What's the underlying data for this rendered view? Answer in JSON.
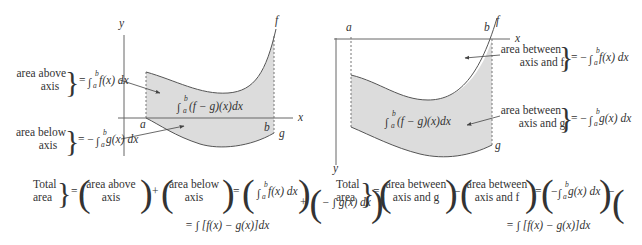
{
  "colors": {
    "fill": "#dcdcdc",
    "curve": "#555555",
    "axis": "#666666",
    "text": "#333333"
  },
  "left_figure": {
    "axis_x_label": "x",
    "axis_y_label": "y",
    "point_a": "a",
    "point_b": "b",
    "curve_f": "f",
    "curve_g": "g",
    "center_integral": "∫(f − g)(x)dx",
    "label_above": {
      "line1": "area above",
      "line2": "axis",
      "equals": "= ∫ f(x) dx"
    },
    "label_below": {
      "line1": "area below",
      "line2": "axis",
      "equals": "= − ∫ g(x) dx"
    },
    "equation": {
      "lhs_line1": "Total",
      "lhs_line2": "area",
      "term1_line1": "area above",
      "term1_line2": "axis",
      "term2_line1": "area below",
      "term2_line2": "axis",
      "term3": "∫ f(x) dx",
      "term4": "− ∫ g(x) dx",
      "result": "= ∫ [f(x) − g(x)]dx"
    }
  },
  "right_figure": {
    "axis_x_label": "x",
    "axis_y_label": "y",
    "point_a": "a",
    "point_b": "b",
    "curve_f": "f",
    "curve_g": "g",
    "center_integral": "∫(f − g)(x)dx",
    "label_f": {
      "line1": "area between",
      "line2": "axis and f",
      "equals": "= − ∫ f(x) dx"
    },
    "label_g": {
      "line1": "area between",
      "line2": "axis and g",
      "equals": "= − ∫ g(x) dx"
    },
    "equation": {
      "lhs_line1": "Total",
      "lhs_line2": "area",
      "term1_line1": "area between",
      "term1_line2": "axis and g",
      "term2_line1": "area between",
      "term2_line2": "axis and f",
      "term3": "− ∫ g(x) dx",
      "term4": "− ∫ f(x) dx",
      "result": "= ∫ [f(x) − g(x)]dx"
    }
  }
}
